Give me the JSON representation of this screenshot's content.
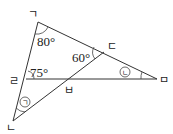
{
  "diagram": {
    "points": {
      "A": "ㄱ",
      "B": "ㄴ",
      "C": "ㄷ",
      "D": "ㄹ",
      "E": "ㅁ",
      "F": "ㅂ"
    },
    "angles": {
      "at_A": "80°",
      "at_D": "75°",
      "at_C": "60°",
      "unknown_B": "ㄱ",
      "unknown_E": "ㄴ"
    },
    "segments": [
      "ㄱ-ㅁ",
      "ㄱ-ㄴ",
      "ㄴ-ㄷ",
      "ㄹ-ㅁ"
    ]
  }
}
